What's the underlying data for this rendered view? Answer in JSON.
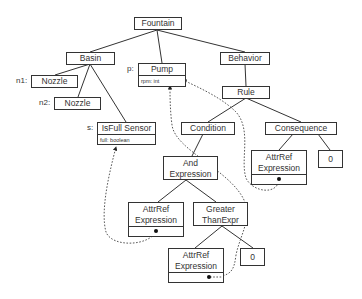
{
  "diagram": {
    "style": {
      "line_color": "#333333",
      "background": "#ffffff"
    },
    "nodes": {
      "fountain": {
        "title": "Fountain"
      },
      "basin": {
        "title": "Basin"
      },
      "nozzle1": {
        "role": "n1:",
        "title": "Nozzle"
      },
      "nozzle2": {
        "role": "n2:",
        "title": "Nozzle"
      },
      "pump": {
        "role": "p:",
        "title": "Pump",
        "attribute": "rpm: int"
      },
      "sensor": {
        "role": "s:",
        "title": "IsFull Sensor",
        "attribute": "full: boolean"
      },
      "behavior": {
        "title": "Behavior"
      },
      "rule": {
        "title": "Rule"
      },
      "condition": {
        "title": "Condition"
      },
      "consequence": {
        "title": "Consequence"
      },
      "and_expr": {
        "title": "And Expression"
      },
      "attrref_left": {
        "title": "AttrRef Expression"
      },
      "greater": {
        "title": "Greater ThanExpr"
      },
      "attrref_bottom": {
        "title": "AttrRef Expression"
      },
      "zero_bottom": {
        "title": "0"
      },
      "attrref_conseq": {
        "title": "AttrRef Expression"
      },
      "zero_conseq": {
        "title": "0"
      }
    },
    "edges": [
      [
        "Fountain",
        "Basin"
      ],
      [
        "Fountain",
        "Pump"
      ],
      [
        "Fountain",
        "Behavior"
      ],
      [
        "Basin",
        "Nozzle (n1)"
      ],
      [
        "Basin",
        "Nozzle (n2)"
      ],
      [
        "Basin",
        "IsFull Sensor"
      ],
      [
        "Behavior",
        "Rule"
      ],
      [
        "Rule",
        "Condition"
      ],
      [
        "Rule",
        "Consequence"
      ],
      [
        "Condition",
        "And Expression"
      ],
      [
        "And Expression",
        "AttrRef Expression"
      ],
      [
        "And Expression",
        "Greater ThanExpr"
      ],
      [
        "Greater ThanExpr",
        "AttrRef Expression"
      ],
      [
        "Greater ThanExpr",
        "0"
      ],
      [
        "Consequence",
        "AttrRef Expression"
      ],
      [
        "Consequence",
        "0"
      ]
    ],
    "references": [
      {
        "from": "AttrRef Expression (under And)",
        "to": "IsFull Sensor.full"
      },
      {
        "from": "AttrRef Expression (under GreaterThan)",
        "to": "Pump.rpm"
      },
      {
        "from": "AttrRef Expression (under Consequence)",
        "to": "Pump.rpm"
      }
    ]
  }
}
